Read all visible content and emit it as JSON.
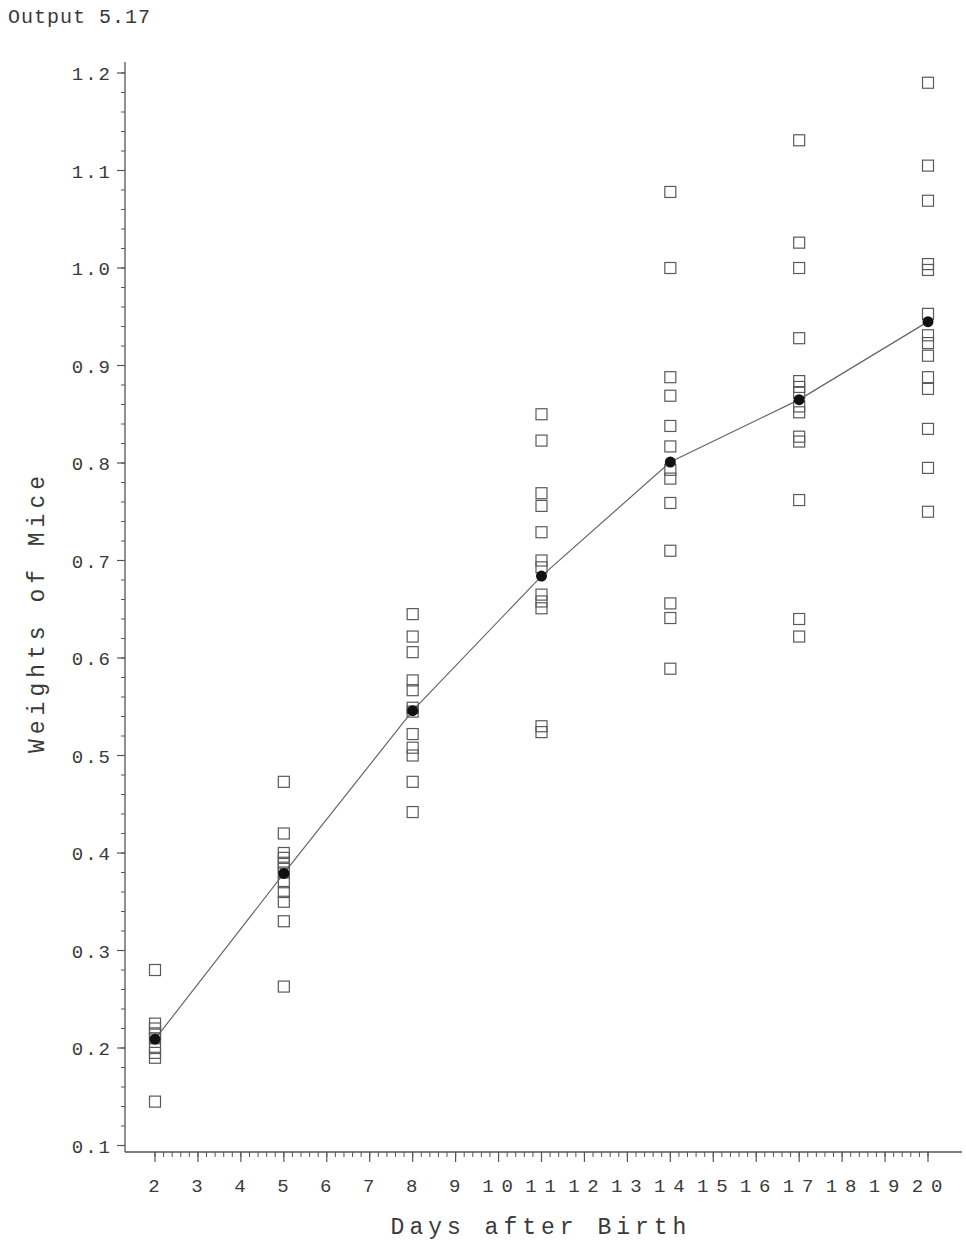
{
  "header": {
    "output_label": "Output 5.17"
  },
  "chart_data": {
    "type": "scatter",
    "title": "",
    "xlabel": "Days after Birth",
    "ylabel": "Weights of Mice",
    "xlim": [
      1.3,
      20.75
    ],
    "ylim": [
      0.1,
      1.2
    ],
    "x_ticks": [
      2,
      3,
      4,
      5,
      6,
      7,
      8,
      9,
      10,
      11,
      12,
      13,
      14,
      15,
      16,
      17,
      18,
      19,
      20
    ],
    "y_ticks": [
      0.1,
      0.2,
      0.3,
      0.4,
      0.5,
      0.6,
      0.7,
      0.8,
      0.9,
      1.0,
      1.1,
      1.2
    ],
    "y_tick_labels": [
      "0.1",
      "0.2",
      "0.3",
      "0.4",
      "0.5",
      "0.6",
      "0.7",
      "0.8",
      "0.9",
      "1.0",
      "1.1",
      "1.2"
    ],
    "x_minor_per_major": 5,
    "y_minor_step": 0.02,
    "grid": false,
    "legend": null,
    "series": [
      {
        "name": "Individual weights",
        "marker": "open-square",
        "points": [
          {
            "day": 2,
            "values": [
              0.28,
              0.225,
              0.22,
              0.215,
              0.21,
              0.2,
              0.195,
              0.19,
              0.145
            ]
          },
          {
            "day": 5,
            "values": [
              0.473,
              0.42,
              0.4,
              0.395,
              0.39,
              0.385,
              0.38,
              0.37,
              0.36,
              0.35,
              0.33,
              0.263
            ]
          },
          {
            "day": 8,
            "values": [
              0.645,
              0.622,
              0.606,
              0.577,
              0.567,
              0.549,
              0.545,
              0.522,
              0.508,
              0.5,
              0.473,
              0.442
            ]
          },
          {
            "day": 11,
            "values": [
              0.85,
              0.823,
              0.769,
              0.756,
              0.729,
              0.7,
              0.693,
              0.665,
              0.658,
              0.651,
              0.53,
              0.524
            ]
          },
          {
            "day": 14,
            "values": [
              1.078,
              1.0,
              0.888,
              0.869,
              0.838,
              0.817,
              0.793,
              0.784,
              0.759,
              0.71,
              0.656,
              0.641,
              0.589
            ]
          },
          {
            "day": 17,
            "values": [
              1.131,
              1.026,
              1.0,
              0.928,
              0.884,
              0.878,
              0.872,
              0.858,
              0.852,
              0.827,
              0.822,
              0.762,
              0.64,
              0.622
            ]
          },
          {
            "day": 20,
            "values": [
              1.19,
              1.105,
              1.069,
              1.004,
              0.998,
              0.953,
              0.931,
              0.923,
              0.91,
              0.888,
              0.876,
              0.835,
              0.795,
              0.75
            ]
          }
        ]
      },
      {
        "name": "Mean weight",
        "marker": "filled-circle",
        "line": true,
        "x": [
          2,
          5,
          8,
          11,
          14,
          17,
          20
        ],
        "values": [
          0.209,
          0.379,
          0.546,
          0.684,
          0.801,
          0.865,
          0.945
        ]
      }
    ],
    "colors": {
      "axis": "#555555",
      "marker": "#5a5a5a",
      "mean": "#111111",
      "line": "#666666"
    }
  }
}
